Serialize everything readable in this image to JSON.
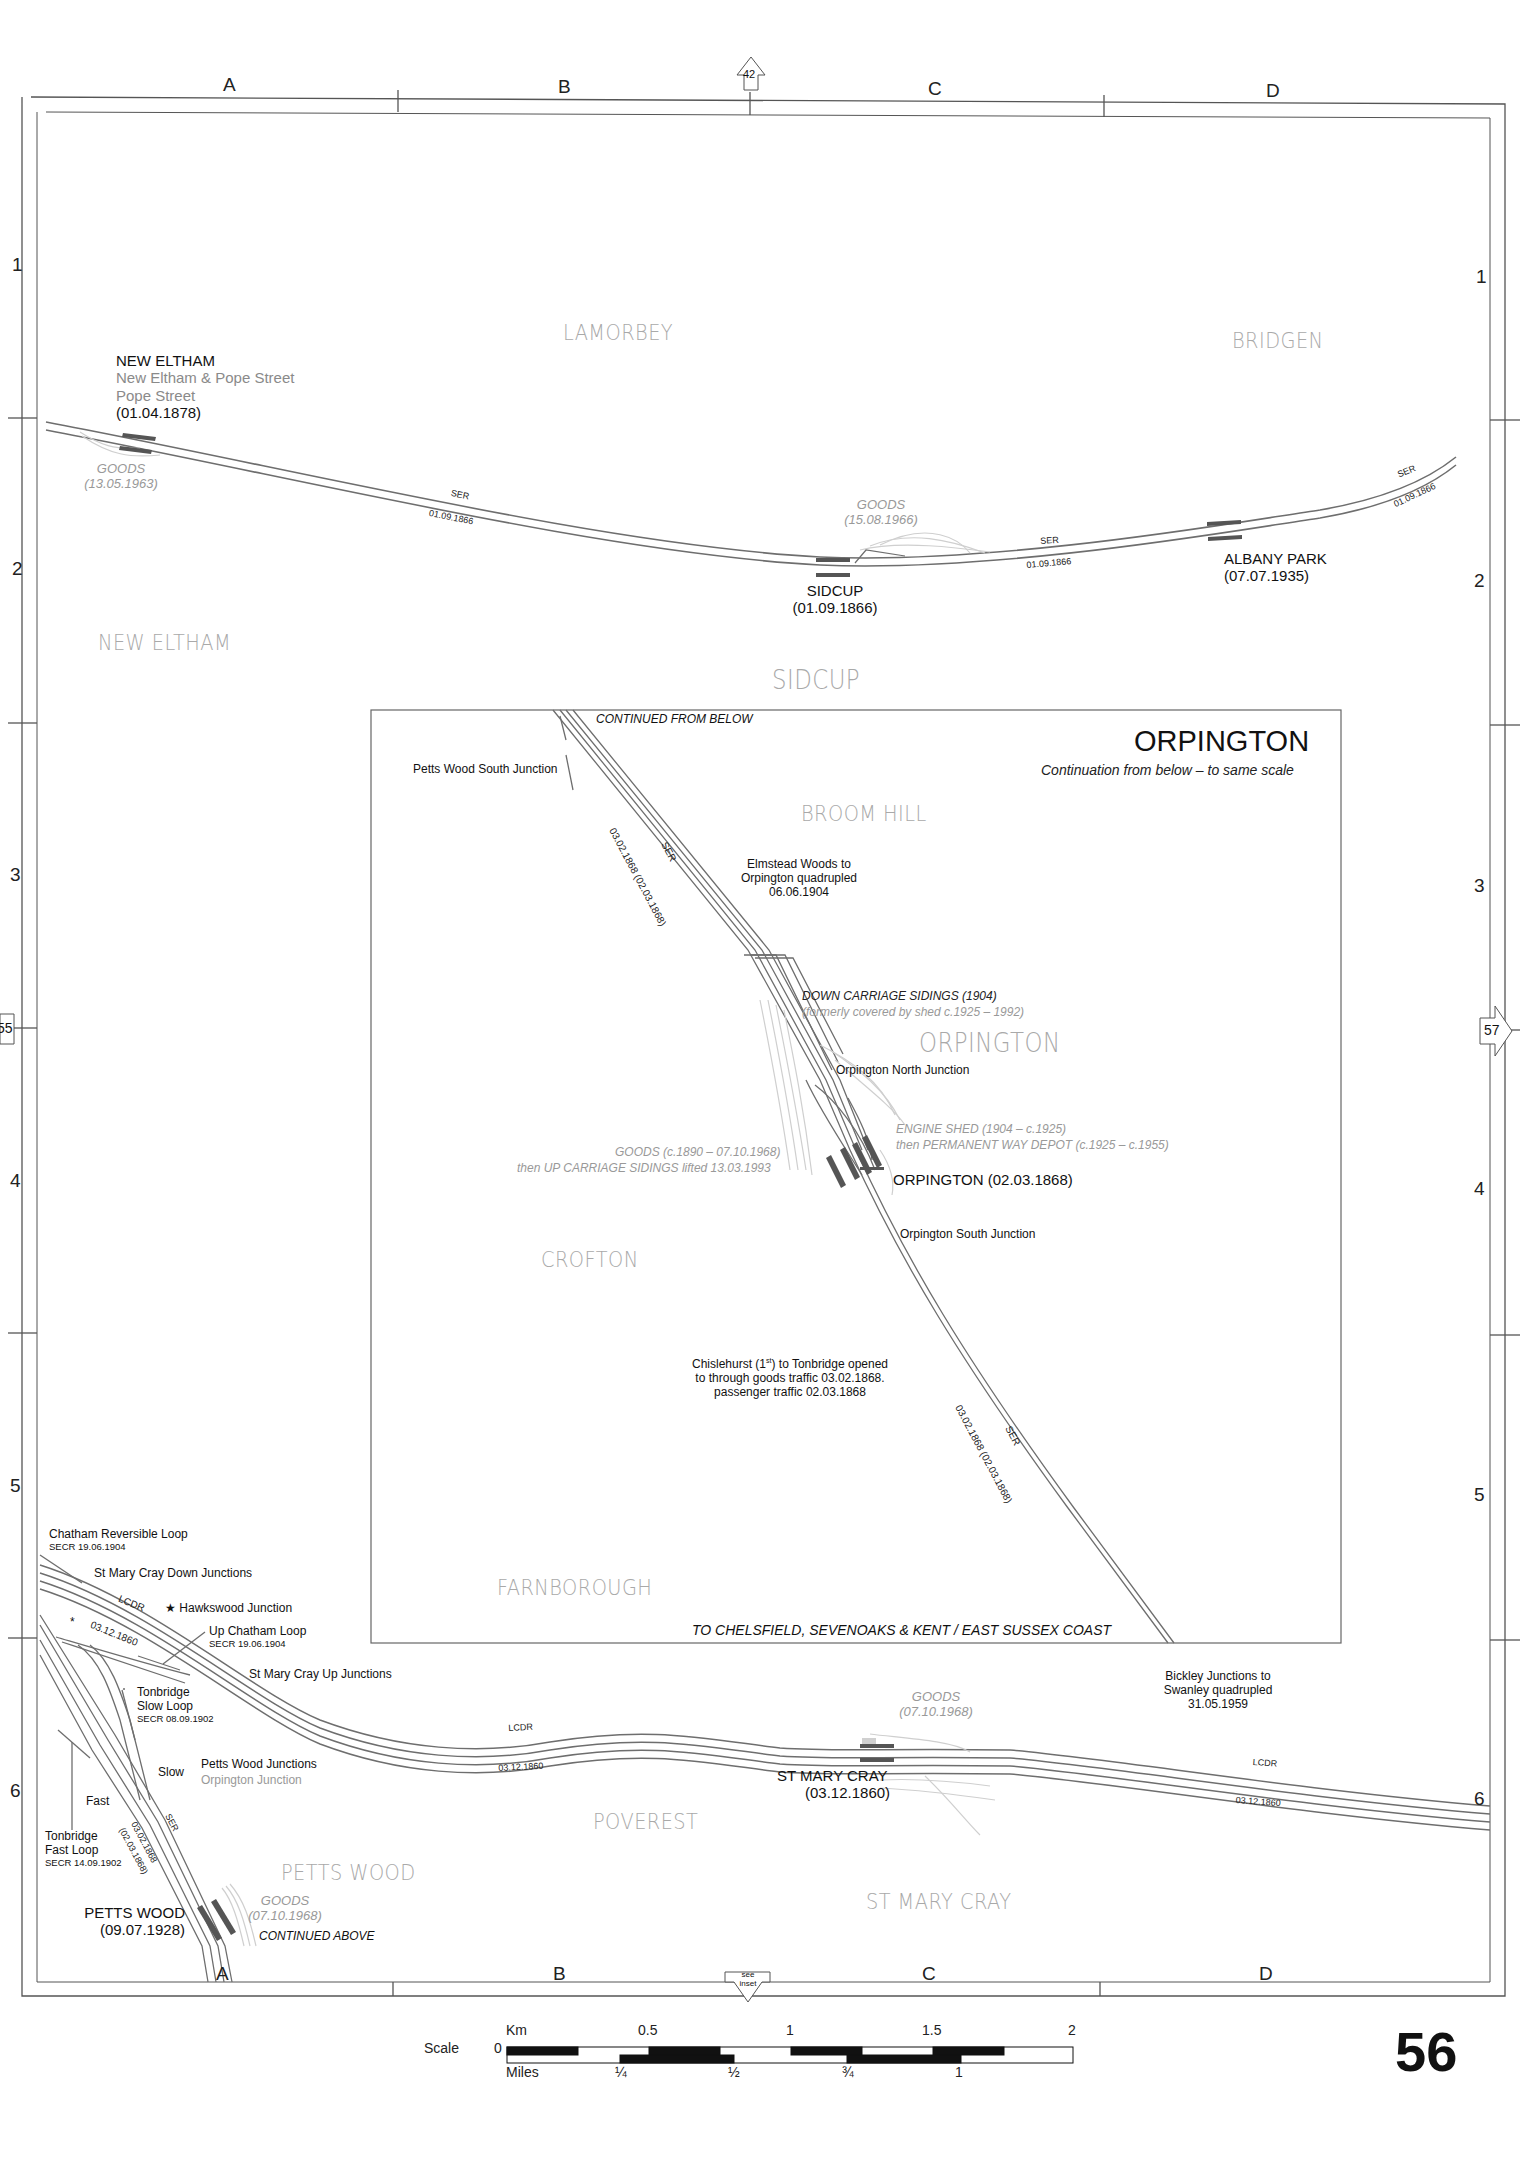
{
  "page": {
    "number": "56"
  },
  "grid": {
    "columns": [
      "A",
      "B",
      "C",
      "D"
    ],
    "rows_left": [
      "1",
      "2",
      "3",
      "4",
      "5",
      "6"
    ],
    "rows_right": [
      "1",
      "2",
      "3",
      "4",
      "5",
      "6"
    ]
  },
  "page_refs": {
    "top": "42",
    "left": "55",
    "right": "57",
    "bottom_line1": "see",
    "bottom_line2": "inset"
  },
  "districts": {
    "lamorbey": "LAMORBEY",
    "bridgen": "BRIDGEN",
    "new_eltham": "NEW ELTHAM",
    "sidcup": "SIDCUP",
    "broom_hill": "BROOM HILL",
    "orpington": "ORPINGTON",
    "crofton": "CROFTON",
    "farnborough": "FARNBOROUGH",
    "poverest": "POVEREST",
    "petts_wood": "PETTS WOOD",
    "st_mary_cray": "ST MARY CRAY"
  },
  "stations": {
    "new_eltham": {
      "name": "NEW ELTHAM",
      "former1": "New Eltham & Pope Street",
      "former2": "Pope Street",
      "opened": "(01.04.1878)"
    },
    "sidcup": {
      "name": "SIDCUP",
      "opened": "(01.09.1866)"
    },
    "albany_park": {
      "name": "ALBANY PARK",
      "opened": "(07.07.1935)"
    },
    "orpington": {
      "name": "ORPINGTON (02.03.1868)"
    },
    "st_mary_cray": {
      "name": "ST MARY CRAY",
      "opened": "(03.12.1860)"
    },
    "petts_wood": {
      "name": "PETTS WOOD",
      "opened": "(09.07.1928)"
    }
  },
  "goods": {
    "new_eltham": {
      "label": "GOODS",
      "date": "(13.05.1963)"
    },
    "sidcup": {
      "label": "GOODS",
      "date": "(15.08.1966)"
    },
    "orpington_1": "GOODS (c.1890 – 07.10.1968)",
    "orpington_2": "then UP CARRIAGE SIDINGS lifted 13.03.1993",
    "st_mary_cray": {
      "label": "GOODS",
      "date": "(07.10.1968)"
    },
    "petts_wood": {
      "label": "GOODS",
      "date": "(07.10.1968)"
    }
  },
  "line_labels": {
    "ser": "SER",
    "lcdr": "LCDR",
    "date_1866": "01.09.1866",
    "date_1860": "03.12.1860",
    "date_1868": "03.02.1868 (02.03.1868)",
    "date_1868_a": "03.02.1868",
    "date_1868_b": "(02.03.1868)"
  },
  "inset": {
    "title": "ORPINGTON",
    "subtitle": "Continuation from below – to same scale",
    "continued_from_below": "CONTINUED FROM BELOW",
    "petts_wood_south_jn": "Petts Wood South Junction",
    "quadrupled_1": "Elmstead Woods to",
    "quadrupled_2": "Orpington quadrupled",
    "quadrupled_3": "06.06.1904",
    "down_sidings": "DOWN CARRIAGE SIDINGS (1904)",
    "down_sidings_note": "(formerly covered by shed c.1925 – 1992)",
    "north_jn": "Orpington North Junction",
    "engine_shed_1": "ENGINE SHED (1904 – c.1925)",
    "engine_shed_2": "then PERMANENT WAY DEPOT (c.1925 – c.1955)",
    "south_jn": "Orpington South Junction",
    "opened_1": "Chislehurst (1st) to Tonbridge opened",
    "opened_1_pre": "Chislehurst (1",
    "opened_1_sup": "st",
    "opened_1_post": ") to Tonbridge opened",
    "opened_2": "to through goods traffic 03.02.1868.",
    "opened_3": "passenger traffic 02.03.1868",
    "to_coast": "TO CHELSFIELD, SEVENOAKS & KENT / EAST SUSSEX COAST"
  },
  "junctions": {
    "chatham_rev_loop": "Chatham Reversible Loop",
    "chatham_rev_loop_date": "SECR 19.06.1904",
    "smc_down_jns": "St Mary Cray Down Junctions",
    "hawkswood_jn": "★ Hawkswood Junction",
    "up_chatham_loop": "Up Chatham Loop",
    "up_chatham_loop_date": "SECR 19.06.1904",
    "smc_up_jns": "St Mary Cray Up Junctions",
    "tonbridge_slow_1": "Tonbridge",
    "tonbridge_slow_2": "Slow Loop",
    "tonbridge_slow_date": "SECR 08.09.1902",
    "slow": "Slow",
    "petts_wood_jns": "Petts Wood Junctions",
    "orpington_jn": "Orpington Junction",
    "fast": "Fast",
    "tonbridge_fast_1": "Tonbridge",
    "tonbridge_fast_2": "Fast Loop",
    "tonbridge_fast_date": "SECR 14.09.1902",
    "continued_above": "CONTINUED ABOVE",
    "bickley_1": "Bickley Junctions to",
    "bickley_2": "Swanley quadrupled",
    "bickley_3": "31.05.1959"
  },
  "scale": {
    "label": "Scale",
    "km_label": "Km",
    "miles_label": "Miles",
    "zero": "0",
    "km_ticks": [
      "0.5",
      "1",
      "1.5",
      "2"
    ],
    "mile_ticks": [
      "¼",
      "½",
      "¾",
      "1"
    ]
  },
  "colors": {
    "track": "#6e6e6e",
    "platform": "#555555",
    "disused": "#c8c8c8",
    "district": "#a9a9a9",
    "frame": "#555555"
  }
}
